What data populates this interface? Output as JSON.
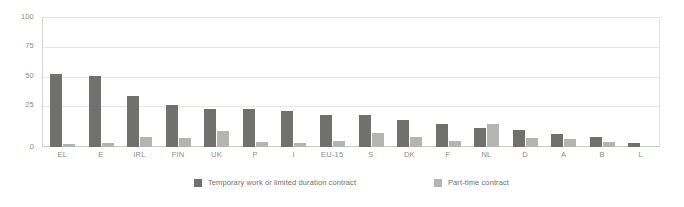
{
  "chart_data": {
    "type": "bar",
    "title": "",
    "subtitle": "",
    "xlabel": "",
    "ylabel": "",
    "ylim": [
      0,
      100
    ],
    "yticks": [
      0,
      25,
      50,
      75,
      100
    ],
    "ytick_labels": [
      "0",
      "25",
      "50",
      "75",
      "100"
    ],
    "grid": true,
    "legend_position": "bottom",
    "categories": [
      "EL",
      "E",
      "IRL",
      "FIN",
      "UK",
      "P",
      "I",
      "EU-15",
      "S",
      "DK",
      "F",
      "NL",
      "D",
      "A",
      "B",
      "L"
    ],
    "series": [
      {
        "name": "Temporary work or limited duration contract",
        "color": "#70706e",
        "values": [
          56,
          55,
          39,
          32,
          29,
          29,
          28,
          25,
          25,
          21,
          18,
          15,
          13,
          10,
          8,
          3
        ]
      },
      {
        "name": "Part-time contract",
        "color": "#b4b4b2",
        "values": [
          2,
          3,
          8,
          7,
          12,
          4,
          3,
          5,
          11,
          8,
          5,
          18,
          7,
          6,
          4,
          0
        ]
      }
    ]
  },
  "legend": {
    "items": [
      {
        "label": "Temporary work or limited duration contract",
        "color": "#70706e"
      },
      {
        "label": "Part-time contract",
        "color": "#b4b4b2"
      }
    ]
  },
  "colors": {
    "background": "#ffffff",
    "grid": "#e7e7e5",
    "axis": "#c9c9c7",
    "tick_text": "#8d8d8b",
    "series_dark": "#70706e",
    "series_light": "#b4b4b2"
  }
}
